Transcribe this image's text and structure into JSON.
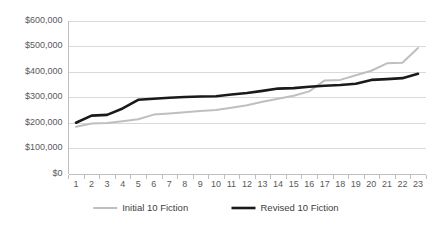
{
  "chart_data": {
    "type": "line",
    "title": "",
    "subtitle": "",
    "xlabel": "",
    "ylabel": "",
    "x": [
      1,
      2,
      3,
      4,
      5,
      6,
      7,
      8,
      9,
      10,
      11,
      12,
      13,
      14,
      15,
      16,
      17,
      18,
      19,
      20,
      21,
      22,
      23
    ],
    "categories": [
      "1",
      "2",
      "3",
      "4",
      "5",
      "6",
      "7",
      "8",
      "9",
      "10",
      "11",
      "12",
      "13",
      "14",
      "15",
      "16",
      "17",
      "18",
      "19",
      "20",
      "21",
      "22",
      "23"
    ],
    "series": [
      {
        "name": "Initial 10 Fiction",
        "color": "#bfbfbf",
        "width": 2.0,
        "values": [
          183000,
          196000,
          198000,
          205000,
          213000,
          231000,
          235000,
          240000,
          245000,
          249000,
          258000,
          268000,
          281000,
          293000,
          305000,
          322000,
          365000,
          367000,
          385000,
          403000,
          432000,
          434000,
          492000
        ]
      },
      {
        "name": "Revised 10 Fiction",
        "color": "#1a1a1a",
        "width": 2.6,
        "values": [
          199000,
          227000,
          230000,
          255000,
          289000,
          293000,
          297000,
          300000,
          302000,
          303000,
          310000,
          316000,
          324000,
          333000,
          335000,
          340000,
          344000,
          347000,
          352000,
          367000,
          370000,
          374000,
          391000
        ]
      }
    ],
    "ylim": [
      0,
      600000
    ],
    "ytick_values": [
      0,
      100000,
      200000,
      300000,
      400000,
      500000,
      600000
    ],
    "ytick_labels": [
      "$0",
      "$100,000",
      "$200,000",
      "$300,000",
      "$400,000",
      "$500,000",
      "$600,000"
    ],
    "grid": true,
    "grid_axis": "y",
    "legend_position": "bottom",
    "legend_entries": [
      "Initial 10 Fiction",
      "Revised 10 Fiction"
    ],
    "colors": {
      "initial_series": "#bfbfbf",
      "revised_series": "#1a1a1a",
      "gridline": "#d9d9d9",
      "axis": "#bfbfbf",
      "text": "#595959",
      "background": "#ffffff"
    }
  },
  "legend": {
    "items": [
      {
        "label": "Initial 10 Fiction"
      },
      {
        "label": "Revised 10 Fiction"
      }
    ]
  },
  "axes": {
    "y": {
      "labels": [
        "$600,000",
        "$500,000",
        "$400,000",
        "$300,000",
        "$200,000",
        "$100,000",
        "$0"
      ]
    },
    "x": {
      "labels": [
        "1",
        "2",
        "3",
        "4",
        "5",
        "6",
        "7",
        "8",
        "9",
        "10",
        "11",
        "12",
        "13",
        "14",
        "15",
        "16",
        "17",
        "18",
        "19",
        "20",
        "21",
        "22",
        "23"
      ]
    }
  }
}
